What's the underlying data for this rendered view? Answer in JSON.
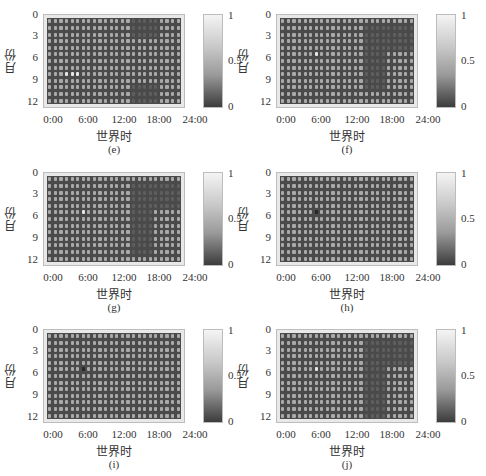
{
  "chart_data": [
    {
      "type": "heatmap",
      "panel": "e",
      "caption": "(e)",
      "xlabel": "世界时",
      "ylabel": "月份",
      "xticks": [
        "0:00",
        "6:00",
        "12:00",
        "18:00",
        "24:00"
      ],
      "yticks": [
        "0",
        "3",
        "6",
        "9",
        "12"
      ],
      "colorbar": {
        "ticks": [
          "1",
          "0.5",
          "0"
        ],
        "range": [
          0,
          1
        ]
      },
      "dark_regions": [
        {
          "x": [
            15,
            19
          ],
          "y": [
            0,
            2
          ]
        },
        {
          "x": [
            15,
            19
          ],
          "y": [
            10,
            12
          ]
        }
      ],
      "bright_points": [
        {
          "x": 3,
          "y": 8
        },
        {
          "x": 4,
          "y": 8
        },
        {
          "x": 5,
          "y": 8
        }
      ],
      "dark_points": []
    },
    {
      "type": "heatmap",
      "panel": "f",
      "caption": "(f)",
      "xlabel": "世界时",
      "ylabel": "月份",
      "xticks": [
        "0:00",
        "6:00",
        "12:00",
        "18:00",
        "24:00"
      ],
      "yticks": [
        "0",
        "3",
        "6",
        "9",
        "12"
      ],
      "colorbar": {
        "ticks": [
          "1",
          "0.5",
          "0"
        ],
        "range": [
          0,
          1
        ]
      },
      "dark_regions": [
        {
          "x": [
            15,
            23
          ],
          "y": [
            1,
            4
          ]
        },
        {
          "x": [
            15,
            18
          ],
          "y": [
            5,
            10
          ]
        }
      ],
      "bright_points": [
        {
          "x": 6,
          "y": 5
        }
      ],
      "dark_points": []
    },
    {
      "type": "heatmap",
      "panel": "g",
      "caption": "(g)",
      "xlabel": "世界时",
      "ylabel": "月份",
      "xticks": [
        "0:00",
        "6:00",
        "12:00",
        "18:00",
        "24:00"
      ],
      "yticks": [
        "0",
        "3",
        "6",
        "9",
        "12"
      ],
      "colorbar": {
        "ticks": [
          "1",
          "0.5",
          "0"
        ],
        "range": [
          0,
          1
        ]
      },
      "dark_regions": [
        {
          "x": [
            15,
            23
          ],
          "y": [
            1,
            4
          ]
        },
        {
          "x": [
            15,
            18
          ],
          "y": [
            5,
            11
          ]
        }
      ],
      "bright_points": [
        {
          "x": 6,
          "y": 5
        }
      ],
      "dark_points": []
    },
    {
      "type": "heatmap",
      "panel": "h",
      "caption": "(h)",
      "xlabel": "世界时",
      "ylabel": "月份",
      "xticks": [
        "0:00",
        "6:00",
        "12:00",
        "18:00",
        "24:00"
      ],
      "yticks": [
        "0",
        "3",
        "6",
        "9",
        "12"
      ],
      "colorbar": {
        "ticks": [
          "1",
          "0.5",
          "0"
        ],
        "range": [
          0,
          1
        ]
      },
      "dark_regions": [],
      "bright_points": [],
      "dark_points": [
        {
          "x": 6,
          "y": 5
        }
      ]
    },
    {
      "type": "heatmap",
      "panel": "i",
      "caption": "(i)",
      "xlabel": "世界时",
      "ylabel": "月份",
      "xticks": [
        "0:00",
        "6:00",
        "12:00",
        "18:00",
        "24:00"
      ],
      "yticks": [
        "0",
        "3",
        "6",
        "9",
        "12"
      ],
      "colorbar": {
        "ticks": [
          "1",
          "0.5",
          "0"
        ],
        "range": [
          0,
          1
        ]
      },
      "dark_regions": [],
      "bright_points": [],
      "dark_points": [
        {
          "x": 6,
          "y": 5
        }
      ]
    },
    {
      "type": "heatmap",
      "panel": "j",
      "caption": "(j)",
      "xlabel": "世界时",
      "ylabel": "月份",
      "xticks": [
        "0:00",
        "6:00",
        "12:00",
        "18:00",
        "24:00"
      ],
      "yticks": [
        "0",
        "3",
        "6",
        "9",
        "12"
      ],
      "colorbar": {
        "ticks": [
          "1",
          "0.5",
          "0"
        ],
        "range": [
          0,
          1
        ]
      },
      "dark_regions": [
        {
          "x": [
            15,
            23
          ],
          "y": [
            1,
            4
          ]
        },
        {
          "x": [
            15,
            18
          ],
          "y": [
            5,
            12
          ]
        }
      ],
      "bright_points": [
        {
          "x": 6,
          "y": 5
        }
      ],
      "dark_points": []
    }
  ],
  "colors": {
    "cell_normal": "#a9a9a9",
    "cell_dark": "#5e5e5e",
    "cell_bright": "#e6e6e6",
    "cell_darkpoint": "#262626",
    "grid_bg": "#4a4a4a"
  },
  "grid": {
    "cols": 24,
    "rows": 13
  }
}
